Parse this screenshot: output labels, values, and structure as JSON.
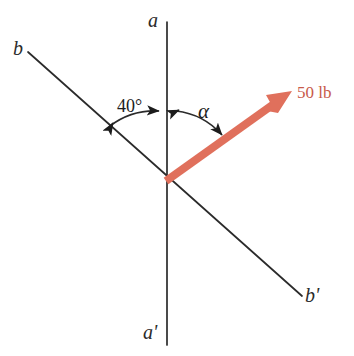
{
  "figure": {
    "width": 354,
    "height": 356,
    "background_color": "#ffffff"
  },
  "colors": {
    "line": "#2b2b2b",
    "vector": "#e0705c",
    "vector_label": "#c85a4a",
    "text": "#1c1c1c"
  },
  "labels": {
    "axis_a": "a",
    "axis_a_prime": "a'",
    "axis_b": "b",
    "axis_b_prime": "b'",
    "angle_40": "40°",
    "angle_alpha": "α",
    "force_magnitude": "50 lb"
  },
  "geometry": {
    "origin": {
      "x": 166,
      "y": 181
    },
    "axis_aa_prime": {
      "x1": 167,
      "y1": 22,
      "x2": 167,
      "y2": 345
    },
    "axis_bb_prime": {
      "x1": 28,
      "y1": 52,
      "x2": 302,
      "y2": 296
    },
    "force_vector": {
      "x1": 166,
      "y1": 181,
      "x2": 292,
      "y2": 91
    },
    "angle_40_degrees": 40,
    "angle_alpha_degrees": null
  },
  "chart_data": {
    "type": "diagram",
    "elements": [
      {
        "name": "axis-aa-prime",
        "kind": "line",
        "label_start": "a",
        "label_end": "a'",
        "orientation": "vertical"
      },
      {
        "name": "axis-bb-prime",
        "kind": "line",
        "label_start": "b",
        "label_end": "b'",
        "orientation": "diagonal-down-right"
      },
      {
        "name": "force-vector",
        "kind": "arrow",
        "label": "50 lb",
        "magnitude": 50,
        "unit": "lb",
        "color": "#e0705c"
      },
      {
        "name": "angle-40",
        "kind": "arc",
        "label": "40°",
        "value": 40,
        "unit": "degrees",
        "between": [
          "axis-b",
          "axis-a"
        ]
      },
      {
        "name": "angle-alpha",
        "kind": "arc",
        "label": "α",
        "value": null,
        "unit": "degrees",
        "between": [
          "axis-a",
          "force-vector"
        ]
      }
    ]
  }
}
